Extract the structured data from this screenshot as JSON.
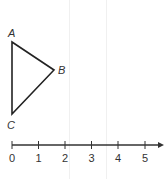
{
  "diagram": {
    "type": "triangle-with-number-line",
    "triangle": {
      "vertices": [
        {
          "label": "A",
          "x": 12,
          "y": 42
        },
        {
          "label": "B",
          "x": 54,
          "y": 70
        },
        {
          "label": "C",
          "x": 12,
          "y": 114
        }
      ],
      "stroke": "#222222"
    },
    "number_line": {
      "ticks": [
        "0",
        "1",
        "2",
        "3",
        "4",
        "5"
      ],
      "has_arrow": true,
      "color": "#333333"
    }
  }
}
